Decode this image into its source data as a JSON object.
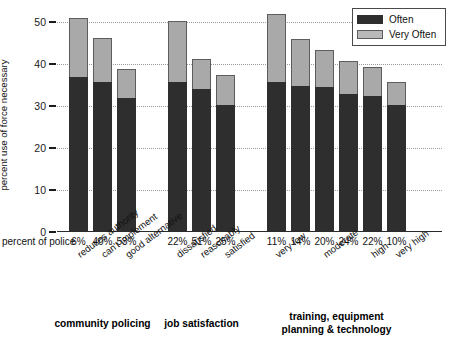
{
  "chart_data": {
    "type": "bar",
    "subtype": "stacked-bar",
    "title": "",
    "xlabel": "",
    "ylabel": "percent use of force necessary",
    "ylim": [
      0,
      50
    ],
    "ytick_values": [
      0,
      10,
      20,
      30,
      40,
      50
    ],
    "ytick_labels": [
      "0",
      "10",
      "20",
      "30",
      "40",
      "50"
    ],
    "grid": true,
    "grid_axis": "y",
    "legend_position": "top-right",
    "categories": [
      "reduces authority",
      "can't implement",
      "good alternative",
      "dissatisfied",
      "reasonably",
      "satisfied",
      "very low",
      "",
      "moderate",
      "",
      "high",
      "very high"
    ],
    "series": [
      {
        "name": "Often",
        "color": "#2e2e2e",
        "values": [
          37.0,
          35.6,
          31.8,
          35.6,
          34.0,
          30.2,
          35.8,
          34.8,
          34.5,
          32.8,
          32.5,
          30.3
        ]
      },
      {
        "name": "Very Often",
        "color": "#a9a9a9",
        "values": [
          14.0,
          10.6,
          7.1,
          14.7,
          7.3,
          7.1,
          16.2,
          11.2,
          8.8,
          8.0,
          6.8,
          5.5
        ]
      }
    ],
    "totals": [
      51.0,
      46.2,
      38.9,
      50.3,
      41.3,
      37.3,
      52.0,
      46.0,
      43.3,
      40.8,
      39.3,
      35.8
    ],
    "secondary_axis_label": "percent of police",
    "secondary_axis_values": [
      "6%",
      "40%",
      "53%",
      "22%",
      "51%",
      "25%",
      "11%",
      "14%",
      "20%",
      "24%",
      "22%",
      "10%"
    ],
    "groups": [
      {
        "title": "community policing",
        "start": 0,
        "count": 3
      },
      {
        "title": "job satisfaction",
        "start": 3,
        "count": 3
      },
      {
        "title": "training, equipment\nplanning & technology",
        "start": 6,
        "count": 6
      }
    ]
  },
  "legend": {
    "items": [
      {
        "label": "Often",
        "color": "#2e2e2e"
      },
      {
        "label": "Very Often",
        "color": "#a9a9a9"
      }
    ]
  },
  "colors": {
    "often": "#2e2e2e",
    "very_often": "#a9a9a9",
    "grid": "#9a9a9a",
    "axis": "#2b2b2b",
    "background": "#ffffff"
  }
}
